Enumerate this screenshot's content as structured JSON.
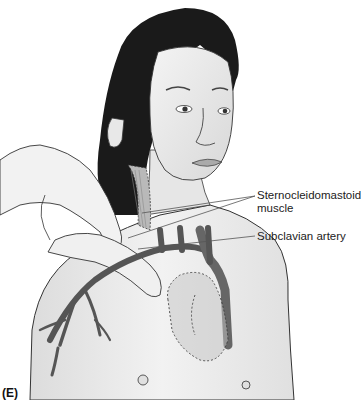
{
  "figure": {
    "panel_label": "(E)",
    "labels": [
      {
        "id": "sternocleidomastoid",
        "lines": [
          "Sternocleidomastoid",
          "muscle"
        ]
      },
      {
        "id": "subclavian",
        "lines": [
          "Subclavian artery"
        ]
      }
    ],
    "colors": {
      "hair": "#1a1a1a",
      "skin": "#ececec",
      "skin_shadow": "#cfcfcf",
      "outline": "#333333",
      "vessel": "#555555",
      "muscle": "#b9b9b9",
      "leader_line": "#555555",
      "heart_shade": "#a9a9a9"
    }
  }
}
